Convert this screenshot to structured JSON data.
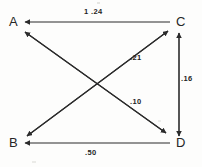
{
  "diagram": {
    "type": "directed-graph",
    "title": "",
    "background_color": "#fdfdfc",
    "stroke_color": "#2b2b2b",
    "text_color": "#262626",
    "nodes": [
      {
        "id": "A",
        "label": "A",
        "x": 14,
        "y": 26,
        "position": "top-left"
      },
      {
        "id": "C",
        "label": "C",
        "x": 180,
        "y": 26,
        "position": "top-right"
      },
      {
        "id": "B",
        "label": "B",
        "x": 14,
        "y": 147,
        "position": "bottom-left"
      },
      {
        "id": "D",
        "label": "D",
        "x": 180,
        "y": 147,
        "position": "bottom-right"
      }
    ],
    "edges": [
      {
        "id": "e-ca",
        "from": "C",
        "to": "A",
        "weight": "1 .24",
        "direction": "left",
        "label_x": 86,
        "label_y": 10
      },
      {
        "id": "e-bc",
        "from": "B",
        "to": "C",
        "weight": ".21",
        "direction": "up-right",
        "label_x": 131,
        "label_y": 55
      },
      {
        "id": "e-ad",
        "from": "A",
        "to": "D",
        "weight": ".10",
        "direction": "down-right",
        "label_x": 131,
        "label_y": 99
      },
      {
        "id": "e-dc",
        "from": "D",
        "to": "C",
        "weight": ".16",
        "direction": "up",
        "label_x": 182,
        "label_y": 76
      },
      {
        "id": "e-db",
        "from": "D",
        "to": "B",
        "weight": ".50",
        "direction": "left",
        "label_x": 86,
        "label_y": 150
      },
      {
        "id": "e-ca-diag",
        "from": "C",
        "to": "B",
        "weight": "",
        "direction": "down-left",
        "label_x": 0,
        "label_y": 0
      },
      {
        "id": "e-da-diag",
        "from": "D",
        "to": "A",
        "weight": "",
        "direction": "up-left",
        "label_x": 0,
        "label_y": 0
      }
    ],
    "edge_labels": {
      "top_horizontal": "1 .24",
      "upper_diagonal": ".21",
      "right_vertical": ".16",
      "lower_diagonal": ".10",
      "bottom_horizontal": ".50"
    }
  }
}
